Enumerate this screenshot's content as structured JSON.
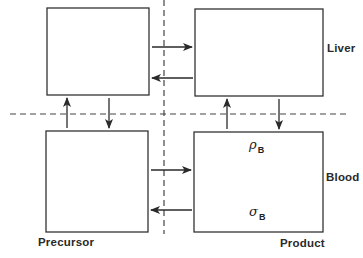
{
  "diagram": {
    "type": "compartment-model",
    "regions": {
      "rows": [
        "Liver",
        "Blood"
      ],
      "columns": [
        "Precursor",
        "Product"
      ]
    },
    "labels": {
      "liver": "Liver",
      "blood": "Blood",
      "precursor": "Precursor",
      "product": "Product"
    },
    "symbols": {
      "rho": {
        "glyph": "ρ",
        "subscript": "B"
      },
      "sigma": {
        "glyph": "σ",
        "subscript": "B"
      }
    },
    "compartments": [
      {
        "id": "precursor-liver",
        "row": "Liver",
        "column": "Precursor"
      },
      {
        "id": "product-liver",
        "row": "Liver",
        "column": "Product"
      },
      {
        "id": "precursor-blood",
        "row": "Blood",
        "column": "Precursor"
      },
      {
        "id": "product-blood",
        "row": "Blood",
        "column": "Product",
        "contains": [
          "ρB",
          "σB"
        ]
      }
    ],
    "flows": [
      {
        "from": "precursor-liver",
        "to": "product-liver"
      },
      {
        "from": "product-liver",
        "to": "precursor-liver"
      },
      {
        "from": "precursor-blood",
        "to": "precursor-liver"
      },
      {
        "from": "precursor-liver",
        "to": "precursor-blood"
      },
      {
        "from": "product-blood",
        "to": "product-liver"
      },
      {
        "from": "product-liver",
        "to": "product-blood"
      },
      {
        "from": "precursor-blood",
        "to": "product-blood"
      },
      {
        "from": "product-blood",
        "to": "precursor-blood"
      }
    ],
    "colors": {
      "line": "#333333",
      "background": "#ffffff"
    }
  }
}
